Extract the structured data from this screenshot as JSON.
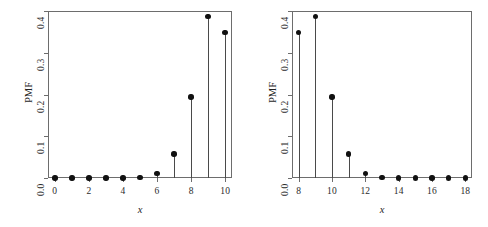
{
  "figure": {
    "background_color": "#ffffff",
    "frame_color": "#6d6d6d",
    "marker_color": "#111111",
    "stem_color": "#4a4a4a"
  },
  "chart_data": [
    {
      "type": "scatter",
      "panel": "left",
      "title": "",
      "subtitle": "",
      "xlabel": "x",
      "ylabel": "PMF",
      "grid": false,
      "legend": null,
      "xlim": [
        -0.4,
        10.4
      ],
      "ylim": [
        0.0,
        0.4
      ],
      "xticks": [
        0,
        2,
        4,
        6,
        8,
        10
      ],
      "xtick_labels": [
        "0",
        "2",
        "4",
        "6",
        "8",
        "10"
      ],
      "yticks": [
        0.0,
        0.1,
        0.2,
        0.3,
        0.4
      ],
      "ytick_labels": [
        "0.0",
        "0.1",
        "0.2",
        "0.3",
        "0.4"
      ],
      "x": [
        0,
        1,
        2,
        3,
        4,
        5,
        6,
        7,
        8,
        9,
        10
      ],
      "values": [
        0.0,
        0.0,
        0.0,
        0.0,
        0.0001,
        0.0015,
        0.0112,
        0.0574,
        0.1937,
        0.3874,
        0.3487
      ],
      "annotations": []
    },
    {
      "type": "scatter",
      "panel": "right",
      "title": "",
      "subtitle": "",
      "xlabel": "x",
      "ylabel": "PMF",
      "grid": false,
      "legend": null,
      "xlim": [
        7.6,
        18.4
      ],
      "ylim": [
        0.0,
        0.4
      ],
      "xticks": [
        8,
        10,
        12,
        14,
        16,
        18
      ],
      "xtick_labels": [
        "8",
        "10",
        "12",
        "14",
        "16",
        "18"
      ],
      "yticks": [
        0.0,
        0.1,
        0.2,
        0.3,
        0.4
      ],
      "ytick_labels": [
        "0.0",
        "0.1",
        "0.2",
        "0.3",
        "0.4"
      ],
      "x": [
        8,
        9,
        10,
        11,
        12,
        13,
        14,
        15,
        16,
        17,
        18
      ],
      "values": [
        0.3487,
        0.3874,
        0.1937,
        0.0574,
        0.0112,
        0.0015,
        0.0001,
        0.0,
        0.0,
        0.0,
        0.0
      ],
      "annotations": []
    }
  ]
}
